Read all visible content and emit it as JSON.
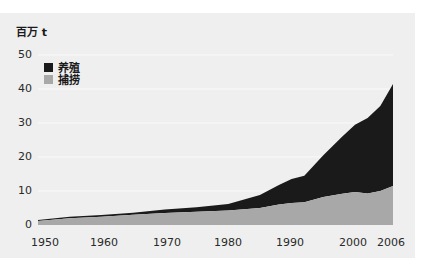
{
  "chart_data": {
    "type": "area",
    "stacked": true,
    "title": "",
    "ylabel": "百万 t",
    "xlabel": "",
    "ylim": [
      0,
      50
    ],
    "xlim": [
      1950,
      2006
    ],
    "grid": true,
    "yticks": [
      0,
      10,
      20,
      30,
      40,
      50
    ],
    "xticks": [
      "1950",
      "1960",
      "1970",
      "1980",
      "1990",
      "2000",
      "2006"
    ],
    "x": [
      1950,
      1955,
      1960,
      1965,
      1970,
      1975,
      1980,
      1985,
      1988,
      1990,
      1992,
      1995,
      1998,
      2000,
      2002,
      2004,
      2006
    ],
    "series": [
      {
        "name": "捕捞",
        "color": "#a8a8a8",
        "values": [
          1.2,
          2.0,
          2.4,
          3.0,
          3.5,
          3.9,
          4.3,
          5.0,
          6.0,
          6.5,
          6.7,
          8.2,
          9.2,
          9.7,
          9.3,
          10.0,
          11.5
        ]
      },
      {
        "name": "养殖",
        "color": "#1a1a1a",
        "values": [
          0.3,
          0.4,
          0.5,
          0.6,
          1.1,
          1.3,
          1.9,
          3.8,
          5.8,
          7.0,
          7.8,
          12.3,
          16.8,
          19.8,
          22.2,
          25.0,
          30.0
        ]
      }
    ],
    "totals": [
      1.5,
      2.4,
      2.9,
      3.6,
      4.6,
      5.2,
      6.2,
      8.8,
      11.8,
      13.5,
      14.5,
      20.5,
      26.0,
      29.5,
      31.5,
      35.0,
      41.5
    ],
    "legend": [
      "养殖",
      "捕捞"
    ],
    "legend_position": "top-left"
  },
  "labels": {
    "unit": "百万 t",
    "legend_aquaculture": "养殖",
    "legend_capture": "捕捞"
  },
  "colors": {
    "aquaculture": "#1a1a1a",
    "capture": "#a8a8a8",
    "panel": "#efefef",
    "grid": "#fafafa"
  }
}
